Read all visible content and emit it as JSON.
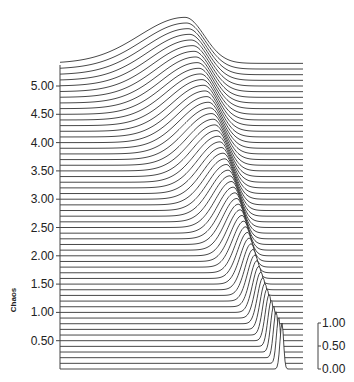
{
  "chart_data": {
    "type": "line",
    "subtype": "ridgeline / waterfall",
    "title": "",
    "ylabel": "Chaos",
    "xlabel": "",
    "y_ticks": [
      "0.50",
      "1.00",
      "1.50",
      "2.00",
      "2.50",
      "3.00",
      "3.50",
      "4.00",
      "4.50",
      "5.00"
    ],
    "y_tick_values": [
      0.5,
      1.0,
      1.5,
      2.0,
      2.5,
      3.0,
      3.5,
      4.0,
      4.5,
      5.0
    ],
    "ylim": [
      0,
      5.4
    ],
    "height_scale_ticks": [
      "0.00",
      "0.50",
      "1.00"
    ],
    "height_scale_values": [
      0.0,
      0.5,
      1.0
    ],
    "n_series": 55,
    "series_description": "Stacked offset curves (one per Chaos value from 0 to ~5.4). Each curve is flat with a single peak of height ~1.0; at low Chaos the peak is a narrow spike at the right edge, and as Chaos increases the peak broadens and shifts left, ending as a smooth gaussian bump centered near the middle-right of the x range at the top.",
    "peak_height": 1.0,
    "grid": false,
    "legend": null
  },
  "axes": {
    "left_axis_label": "Chaos",
    "right_scale_label": ""
  }
}
